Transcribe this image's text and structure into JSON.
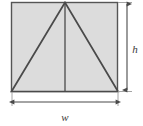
{
  "figure": {
    "type": "geometry-diagram",
    "background_color": "#ffffff",
    "shape_fill_color": "#dcdcdc",
    "shape_stroke_color": "#555555",
    "line_color": "#4a4a4a",
    "label_color": "#3a3a3a",
    "rectangle": {
      "name": "shaded-square",
      "left": 11,
      "top": 2,
      "right": 118,
      "bottom": 92,
      "width": 107,
      "height": 90
    },
    "triangle": {
      "name": "inscribed-triangle",
      "apex_x": 65,
      "apex_y": 2,
      "base_left_x": 11,
      "base_right_x": 118,
      "base_y": 92
    },
    "median": {
      "name": "vertical-median-line",
      "x": 65,
      "y_top": 2,
      "y_bottom": 92
    },
    "dimensions": {
      "height": {
        "label": "h",
        "orientation": "vertical",
        "line_x": 127,
        "y_top": 2,
        "y_bottom": 92,
        "label_x": 135,
        "label_y": 50
      },
      "width": {
        "label": "w",
        "orientation": "horizontal",
        "line_y": 102,
        "x_left": 12,
        "x_right": 118,
        "label_x": 65,
        "label_y": 118
      }
    }
  }
}
